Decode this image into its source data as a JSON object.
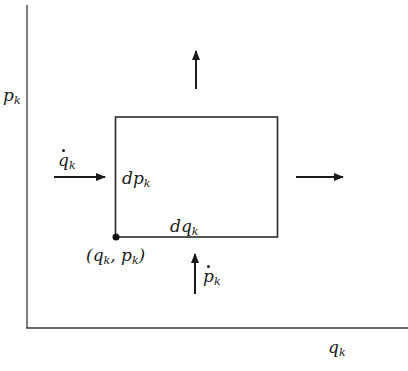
{
  "diagram": {
    "type": "phase-space-element",
    "colors": {
      "line": "#3a3a3a",
      "arrow": "#1a1a1a",
      "background": "#ffffff"
    },
    "axes": {
      "x_label_var": "q",
      "x_label_sub": "k",
      "y_label_var": "p",
      "y_label_sub": "k"
    },
    "rectangle": {
      "width_label_var": "dq",
      "width_label_sub": "k",
      "height_label_var": "dp",
      "height_label_sub": "k"
    },
    "corner_point": {
      "open": "(",
      "q_var": "q",
      "q_sub": "k",
      "sep": ", ",
      "p_var": "p",
      "p_sub": "k",
      "close": ")"
    },
    "arrows": {
      "left_in": {
        "label_var": "q",
        "label_sub": "k",
        "dotted": true,
        "direction": "right"
      },
      "right_out": {
        "label": "",
        "direction": "right"
      },
      "bottom_in": {
        "label_var": "p",
        "label_sub": "k",
        "dotted": true,
        "direction": "up"
      },
      "top_out": {
        "label": "",
        "direction": "up"
      }
    }
  }
}
